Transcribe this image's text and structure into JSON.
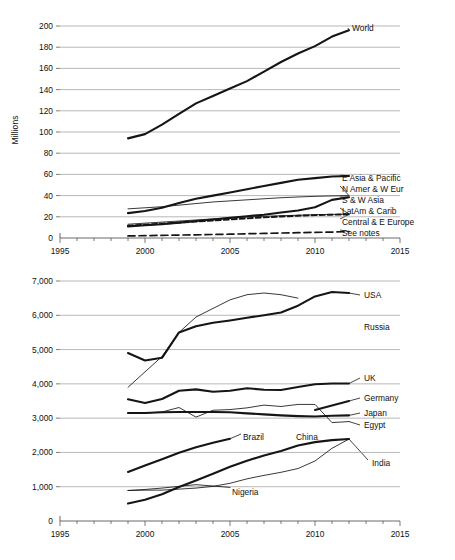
{
  "figure": {
    "ylabel_top": "Millions",
    "ylabel_bottom": "Per 100,000 population"
  },
  "chart_data": [
    {
      "type": "line",
      "id": "top",
      "title": "",
      "xlabel": "",
      "ylabel": "Millions",
      "xlim": [
        1995,
        2015
      ],
      "ylim": [
        0,
        200
      ],
      "xticks": [
        1995,
        2000,
        2005,
        2010,
        2015
      ],
      "yticks": [
        0,
        20,
        40,
        60,
        80,
        100,
        120,
        140,
        160,
        180,
        200
      ],
      "grid": true,
      "legend_position": "right-inline",
      "x": [
        1999,
        2000,
        2001,
        2002,
        2003,
        2004,
        2005,
        2006,
        2007,
        2008,
        2009,
        2010,
        2011,
        2012
      ],
      "series": [
        {
          "name": "World",
          "style": "solid-thick",
          "values": [
            94,
            98,
            107,
            117,
            127,
            134,
            141,
            148,
            157,
            166,
            174,
            181,
            190,
            196
          ]
        },
        {
          "name": "E Asia & Pacific",
          "style": "solid-thick",
          "values": [
            23.5,
            25.5,
            28.5,
            33,
            37,
            40,
            43,
            46,
            49,
            52,
            55,
            56.5,
            58,
            58.5
          ]
        },
        {
          "name": "N Amer & W Eur",
          "style": "solid-thin",
          "values": [
            27.5,
            28.5,
            29.5,
            31,
            32.5,
            34,
            35,
            36,
            37,
            38,
            38.7,
            39.3,
            39.7,
            40
          ]
        },
        {
          "name": "S & W Asia",
          "style": "solid-thick",
          "values": [
            11,
            12,
            13,
            14.5,
            16,
            17.5,
            19,
            20.5,
            22,
            24,
            26,
            29,
            36,
            38.5
          ]
        },
        {
          "name": "LatAm & Carib",
          "style": "solid-thin",
          "values": [
            13,
            14,
            15,
            16,
            17,
            18,
            19,
            19.8,
            20.5,
            21,
            21.5,
            22,
            22.3,
            22.5
          ]
        },
        {
          "name": "Central & E Europe",
          "style": "dashed",
          "values": [
            11.5,
            12.5,
            13.5,
            14.5,
            15.5,
            16.5,
            17.5,
            18.5,
            19.5,
            20.3,
            21,
            21.6,
            22,
            22.3
          ]
        },
        {
          "name": "See notes",
          "style": "dashed-wide",
          "values": [
            2,
            2.2,
            2.5,
            2.8,
            3,
            3.3,
            3.6,
            4,
            4.3,
            4.7,
            5,
            5.3,
            5.6,
            6
          ]
        }
      ]
    },
    {
      "type": "line",
      "id": "bottom",
      "title": "",
      "xlabel": "",
      "ylabel": "Per 100,000 population",
      "xlim": [
        1995,
        2015
      ],
      "ylim": [
        0,
        7000
      ],
      "xticks": [
        1995,
        2000,
        2005,
        2010,
        2015
      ],
      "yticks": [
        0,
        1000,
        2000,
        3000,
        4000,
        5000,
        6000,
        7000
      ],
      "grid": true,
      "legend_position": "right-inline",
      "x": [
        1999,
        2000,
        2001,
        2002,
        2003,
        2004,
        2005,
        2006,
        2007,
        2008,
        2009,
        2010,
        2011,
        2012
      ],
      "series": [
        {
          "name": "USA",
          "style": "solid-thin",
          "values": [
            3900,
            4350,
            4800,
            5500,
            5950,
            6200,
            6450,
            6600,
            6650,
            6600,
            6500,
            null,
            null,
            null
          ]
        },
        {
          "name": "Russia",
          "style": "solid-thick",
          "values": [
            4900,
            4680,
            4760,
            5500,
            5680,
            5780,
            5850,
            5930,
            6000,
            6080,
            6280,
            6550,
            6680,
            6650
          ]
        },
        {
          "name": "UK",
          "style": "solid-thick",
          "values": [
            3550,
            3440,
            3560,
            3800,
            3840,
            3770,
            3800,
            3870,
            3830,
            3820,
            3910,
            3990,
            4010,
            4010
          ]
        },
        {
          "name": "Germany",
          "style": "solid-thick",
          "values": [
            null,
            null,
            null,
            null,
            null,
            null,
            null,
            null,
            null,
            null,
            null,
            3240,
            3370,
            3500
          ]
        },
        {
          "name": "Japan",
          "style": "solid-thick",
          "values": [
            3150,
            3150,
            3170,
            3180,
            3180,
            3180,
            3170,
            3140,
            3110,
            3080,
            3060,
            3050,
            3070,
            3080
          ]
        },
        {
          "name": "Egypt",
          "style": "solid-thin",
          "values": [
            3150,
            3150,
            3180,
            3310,
            3030,
            3230,
            3250,
            3300,
            3380,
            3340,
            3400,
            3400,
            2870,
            2900
          ]
        },
        {
          "name": "Brazil",
          "style": "solid-thick",
          "values": [
            1430,
            1620,
            1800,
            1990,
            2150,
            2280,
            2400,
            null,
            null,
            null,
            null,
            null,
            null,
            null
          ]
        },
        {
          "name": "China",
          "style": "solid-thick",
          "values": [
            510,
            620,
            780,
            990,
            1180,
            1380,
            1580,
            1760,
            1910,
            2040,
            2200,
            2300,
            2360,
            2390
          ]
        },
        {
          "name": "India",
          "style": "solid-thin",
          "values": [
            890,
            900,
            900,
            930,
            960,
            1010,
            1100,
            1230,
            1330,
            1420,
            1530,
            1750,
            2120,
            2390
          ]
        },
        {
          "name": "Nigeria",
          "style": "solid-thin",
          "values": [
            890,
            920,
            960,
            1010,
            1060,
            1020,
            980,
            null,
            null,
            null,
            null,
            null,
            null,
            null
          ]
        }
      ]
    }
  ],
  "labels_top": [
    {
      "text": "World",
      "x": 352,
      "y": 31
    },
    {
      "text": "E Asia & Pacific",
      "x": 342,
      "y": 181
    },
    {
      "text": "N Amer & W Eur",
      "x": 342,
      "y": 192
    },
    {
      "text": "S & W Asia",
      "x": 342,
      "y": 203
    },
    {
      "text": "LatAm & Carib",
      "x": 342,
      "y": 214
    },
    {
      "text": "Central & E Europe",
      "x": 342,
      "y": 225
    },
    {
      "text": "See notes",
      "x": 342,
      "y": 236
    }
  ],
  "labels_bottom": [
    {
      "text": "USA",
      "x": 364,
      "y": 298
    },
    {
      "text": "Russia",
      "x": 364,
      "y": 330
    },
    {
      "text": "UK",
      "x": 364,
      "y": 381
    },
    {
      "text": "Germany",
      "x": 364,
      "y": 401
    },
    {
      "text": "Japan",
      "x": 364,
      "y": 416
    },
    {
      "text": "Egypt",
      "x": 364,
      "y": 428
    },
    {
      "text": "Brazil",
      "x": 243,
      "y": 440
    },
    {
      "text": "China",
      "x": 296,
      "y": 440
    },
    {
      "text": "India",
      "x": 372,
      "y": 466
    },
    {
      "text": "Nigeria",
      "x": 232,
      "y": 495
    }
  ]
}
